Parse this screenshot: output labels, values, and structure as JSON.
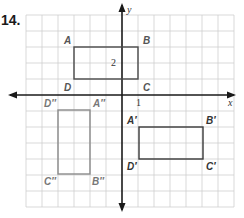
{
  "problem": {
    "number": "14."
  },
  "axes": {
    "x_label": "x",
    "y_label": "y",
    "x_tick_label": "1",
    "y_tick_label": "2"
  },
  "grid": {
    "x_range": [
      -6,
      7
    ],
    "y_range": [
      -7,
      5
    ],
    "unit_px": 16,
    "origin_px": [
      122,
      95
    ]
  },
  "figures": [
    {
      "name": "ABCD",
      "color": "#4a4a4a",
      "vertices": [
        {
          "label": "A",
          "x": -3,
          "y": 3
        },
        {
          "label": "B",
          "x": 1,
          "y": 3
        },
        {
          "label": "C",
          "x": 1,
          "y": 1
        },
        {
          "label": "D",
          "x": -3,
          "y": 1
        }
      ]
    },
    {
      "name": "A'B'C'D'",
      "color": "#3a3a3a",
      "vertices": [
        {
          "label": "A′",
          "x": 1,
          "y": -2
        },
        {
          "label": "B′",
          "x": 5,
          "y": -2
        },
        {
          "label": "C′",
          "x": 5,
          "y": -4
        },
        {
          "label": "D′",
          "x": 1,
          "y": -4
        }
      ]
    },
    {
      "name": "A''B''C''D''",
      "color": "#8a8a8a",
      "vertices": [
        {
          "label": "A″",
          "x": -2,
          "y": -1
        },
        {
          "label": "B″",
          "x": -2,
          "y": -5
        },
        {
          "label": "C″",
          "x": -4,
          "y": -5
        },
        {
          "label": "D″",
          "x": -4,
          "y": -1
        }
      ]
    }
  ]
}
